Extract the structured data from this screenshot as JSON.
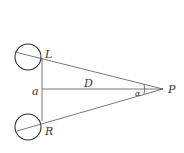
{
  "diagram": {
    "labels": {
      "left_eye": "L",
      "right_eye": "R",
      "separation": "a",
      "distance": "D",
      "angle": "α",
      "point": "P"
    },
    "colors": {
      "line": "#555555",
      "text": "#333333",
      "background": "#ffffff"
    }
  }
}
